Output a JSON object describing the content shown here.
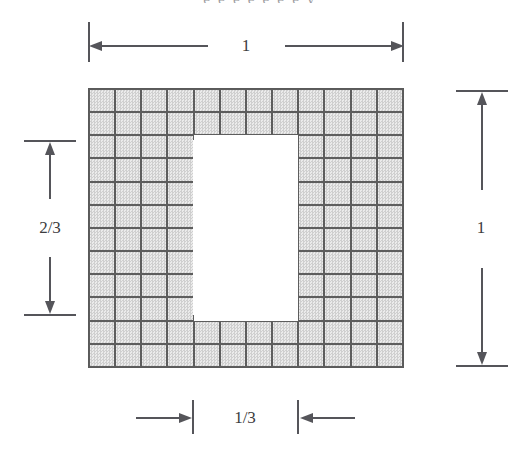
{
  "figure": {
    "clipped_header_text": "e e e e e e e y",
    "background_color": "#ffffff",
    "cell_fill_color": "#d8d8d8",
    "cell_border_color": "#5d5d5d",
    "hole_fill_color": "#ffffff",
    "dimension_line_color": "#55555a"
  },
  "chart_data": {
    "type": "diagram",
    "title": "",
    "grid": {
      "columns": 12,
      "rows": 12,
      "total_cells": 144,
      "shaded_cells": 112,
      "hole_cells": 32
    },
    "hole": {
      "col_start": 5,
      "col_end": 8,
      "row_start": 3,
      "row_end": 10,
      "width_cells": 4,
      "height_cells": 8,
      "width_fraction": "1/3",
      "height_fraction": "2/3"
    },
    "annotations": [
      {
        "id": "top",
        "label": "1",
        "orientation": "horizontal",
        "measures": "outer square width"
      },
      {
        "id": "right",
        "label": "1",
        "orientation": "vertical",
        "measures": "outer square height"
      },
      {
        "id": "left",
        "label": "2/3",
        "orientation": "vertical",
        "measures": "hole height"
      },
      {
        "id": "bottom",
        "label": "1/3",
        "orientation": "horizontal",
        "measures": "hole width"
      }
    ]
  },
  "dimensions": {
    "top": {
      "label": "1"
    },
    "right": {
      "label": "1"
    },
    "left": {
      "label": "2/3"
    },
    "bottom": {
      "label": "1/3"
    }
  }
}
